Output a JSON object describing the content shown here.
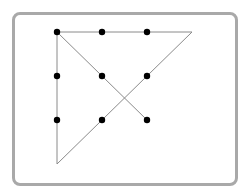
{
  "puzzle": {
    "name": "nine-dot puzzle",
    "grid": {
      "rows": 3,
      "cols": 3
    },
    "dot_color": "#000000",
    "line_color": "#8a8a8a",
    "frame_color": "#a9a9a9",
    "dots": [
      {
        "row": 0,
        "col": 0
      },
      {
        "row": 0,
        "col": 1
      },
      {
        "row": 0,
        "col": 2
      },
      {
        "row": 1,
        "col": 0
      },
      {
        "row": 1,
        "col": 1
      },
      {
        "row": 1,
        "col": 2
      },
      {
        "row": 2,
        "col": 0
      },
      {
        "row": 2,
        "col": 1
      },
      {
        "row": 2,
        "col": 2
      }
    ],
    "solution_path": [
      {
        "row": 2,
        "col": 2
      },
      {
        "row": 0,
        "col": 0
      },
      {
        "row": 0,
        "col": 3
      },
      {
        "row": 3,
        "col": 0
      },
      {
        "row": 0,
        "col": 0
      }
    ]
  }
}
